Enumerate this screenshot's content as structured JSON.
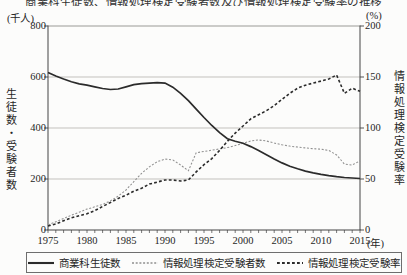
{
  "figure": {
    "clipped_title": "商業科生徒数、情報処理検定受験者数及び情報処理検定受験率の推移"
  },
  "chart_data": {
    "type": "line",
    "x": [
      1975,
      1976,
      1977,
      1978,
      1979,
      1980,
      1981,
      1982,
      1983,
      1984,
      1985,
      1986,
      1987,
      1988,
      1989,
      1990,
      1991,
      1992,
      1993,
      1994,
      1995,
      1996,
      1997,
      1998,
      1999,
      2000,
      2001,
      2002,
      2003,
      2004,
      2005,
      2006,
      2007,
      2008,
      2009,
      2010,
      2011,
      2012,
      2013,
      2014,
      2015
    ],
    "series": [
      {
        "name": "商業科生徒数",
        "axis": "left",
        "style": "solid",
        "color": "#2b2b2b",
        "values": [
          618,
          604,
          592,
          581,
          573,
          568,
          561,
          555,
          551,
          553,
          561,
          570,
          574,
          576,
          578,
          576,
          560,
          536,
          507,
          474,
          441,
          410,
          382,
          358,
          348,
          340,
          327,
          312,
          295,
          278,
          263,
          250,
          240,
          231,
          224,
          218,
          213,
          209,
          206,
          204,
          202
        ]
      },
      {
        "name": "情報処理検定受験者数",
        "axis": "left",
        "style": "fine-dotted",
        "color": "#8f8f8f",
        "values": [
          20,
          32,
          45,
          58,
          70,
          82,
          91,
          100,
          114,
          133,
          157,
          190,
          222,
          248,
          268,
          278,
          275,
          255,
          232,
          303,
          308,
          313,
          318,
          323,
          331,
          340,
          349,
          353,
          349,
          341,
          334,
          329,
          325,
          322,
          319,
          317,
          312,
          294,
          259,
          255,
          271
        ]
      },
      {
        "name": "情報処理検定受験率",
        "axis": "right",
        "style": "dashed",
        "color": "#2b2b2b",
        "values": [
          4,
          6,
          9,
          12,
          14,
          16,
          19,
          23,
          27,
          31,
          34,
          38,
          41,
          45,
          47,
          49,
          49,
          48,
          49,
          57,
          64,
          70,
          78,
          87,
          95,
          102,
          109,
          113,
          117,
          122,
          128,
          134,
          139,
          142,
          144,
          146,
          148,
          152,
          134,
          139,
          136
        ]
      }
    ],
    "left_axis": {
      "unit": "(千人)",
      "title": "生徒数・受験者数",
      "ticks": [
        800,
        600,
        400,
        200,
        0
      ],
      "range": [
        0,
        800
      ]
    },
    "right_axis": {
      "unit": "(%)",
      "title": "情報処理検定受験率",
      "ticks": [
        200,
        150,
        100,
        50,
        0
      ],
      "range": [
        0,
        200
      ]
    },
    "x_axis": {
      "unit": "(年)",
      "tick_labels": [
        1975,
        1980,
        1985,
        1990,
        1995,
        2000,
        2005,
        2010,
        2015
      ],
      "range": [
        1975,
        2015
      ],
      "minor_tick_every": 1
    },
    "grid": "horizontal gridlines at left-axis 200/400/600 (right-axis 50/100/150)",
    "legend_position": "bottom-boxed",
    "title": "",
    "xlabel": "(年)",
    "ylabel_left": "生徒数・受験者数 (千人)",
    "ylabel_right": "情報処理検定受験率 (%)"
  }
}
